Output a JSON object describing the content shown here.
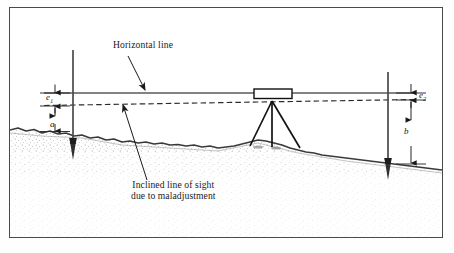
{
  "figure": {
    "kind": "surveying-diagram",
    "title_text": "",
    "border_color": "#4a4a4a",
    "background": "#ffffff"
  },
  "labels": {
    "horizontal_line": "Horizontal line",
    "inclined_line_1": "Inclined line of sight",
    "inclined_line_2": "due to maladjustment"
  },
  "dimensions": {
    "e1": "e",
    "e1_sub": "1",
    "a": "a",
    "e2": "e",
    "e2_sub": "2",
    "b": "b"
  },
  "colors": {
    "ink": "#1a1a1a",
    "ground_line": "#3a3a3a",
    "stipple": "#8a8a8a",
    "rod": "#4a4a4a",
    "rod_tip": "#2b2b2b",
    "instrument_fill": "#ffffff",
    "instrument_stroke": "#111111",
    "dashed_sight": "#2b2b2b",
    "horizontal_sight": "#5a5a5a"
  },
  "elements": {
    "instrument": "level-telescope-on-tripod",
    "left_rod": "staff-rod-left",
    "right_rod": "staff-rod-right",
    "horizontal_line": "solid-horizontal-line-of-collimation",
    "inclined_line": "dashed-inclined-line-of-sight",
    "terrain": "stippled-ground-profile"
  }
}
